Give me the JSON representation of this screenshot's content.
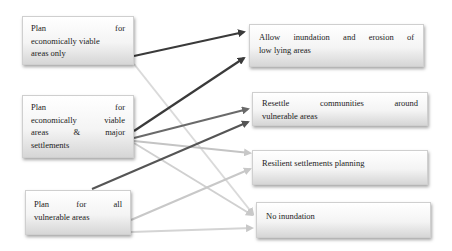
{
  "diagram": {
    "left_nodes": [
      {
        "id": "L1",
        "lines": [
          "Plan for",
          "economically viable",
          "areas only"
        ],
        "label": "Plan for economically viable areas only"
      },
      {
        "id": "L2",
        "lines": [
          "Plan for",
          "economically viable",
          "areas & major",
          "settlements"
        ],
        "label": "Plan for economically viable areas & major settlements"
      },
      {
        "id": "L3",
        "lines": [
          "Plan for all",
          "vulnerable areas"
        ],
        "label": "Plan for all vulnerable areas"
      }
    ],
    "right_nodes": [
      {
        "id": "R1",
        "lines": [
          "Allow inundation and erosion of",
          "low lying areas"
        ],
        "label": "Allow inundation and erosion of low lying areas"
      },
      {
        "id": "R2",
        "lines": [
          "Resettle communities around",
          "vulnerable areas"
        ],
        "label": "Resettle communities around vulnerable areas"
      },
      {
        "id": "R3",
        "lines": [
          "Resilient settlements planning"
        ],
        "label": "Resilient settlements planning"
      },
      {
        "id": "R4",
        "lines": [
          "No inundation"
        ],
        "label": "No inundation"
      }
    ],
    "edges": [
      {
        "from": "L1",
        "to": "R1",
        "color": "#3a3a3a"
      },
      {
        "from": "L1",
        "to": "R4",
        "color": "#d8d8d8"
      },
      {
        "from": "L2",
        "to": "R1",
        "color": "#3a3a3a"
      },
      {
        "from": "L2",
        "to": "R2",
        "color": "#6a6a6a"
      },
      {
        "from": "L2",
        "to": "R3",
        "color": "#c4c4c4"
      },
      {
        "from": "L2",
        "to": "R4",
        "color": "#d0d0d0"
      },
      {
        "from": "L3",
        "to": "R2",
        "color": "#555555"
      },
      {
        "from": "L3",
        "to": "R3",
        "color": "#c8c8c8"
      },
      {
        "from": "L3",
        "to": "R4",
        "color": "#d4d4d4"
      }
    ]
  },
  "colors": {
    "dark_arrow": "#3a3a3a",
    "medium_arrow": "#6a6a6a",
    "light_arrow": "#cfcfcf",
    "box_border": "#cfcfcf"
  }
}
